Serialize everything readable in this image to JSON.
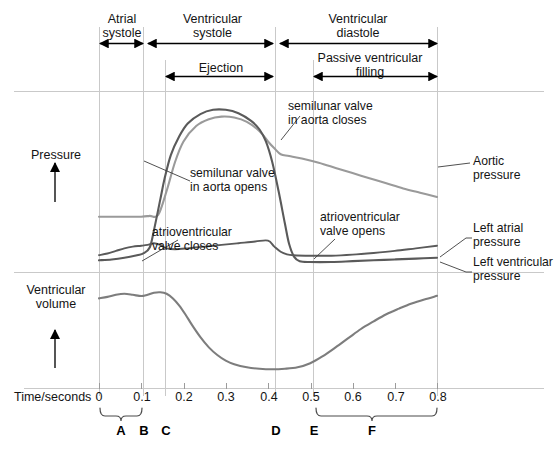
{
  "chart_data": {
    "type": "line",
    "xlabel": "Time/seconds",
    "xlim": [
      0,
      0.8
    ],
    "xticks": [
      "0",
      "0.1",
      "0.2",
      "0.3",
      "0.4",
      "0.5",
      "0.6",
      "0.7",
      "0.8"
    ],
    "grid": "vertical event lines only",
    "legend": "inline right-hand labels",
    "panels": [
      {
        "name": "pressure",
        "ylabel": "Pressure",
        "yaxis": "unlabelled, increasing upward",
        "series": [
          {
            "name": "Aortic pressure",
            "color": "#9a9a9a",
            "points": [
              [
                0.0,
                0.3
              ],
              [
                0.05,
                0.3
              ],
              [
                0.1,
                0.3
              ],
              [
                0.12,
                0.305
              ],
              [
                0.14,
                0.31
              ],
              [
                0.16,
                0.45
              ],
              [
                0.18,
                0.62
              ],
              [
                0.2,
                0.74
              ],
              [
                0.23,
                0.83
              ],
              [
                0.26,
                0.87
              ],
              [
                0.29,
                0.885
              ],
              [
                0.32,
                0.88
              ],
              [
                0.35,
                0.855
              ],
              [
                0.38,
                0.8
              ],
              [
                0.4,
                0.74
              ],
              [
                0.415,
                0.7
              ],
              [
                0.43,
                0.665
              ],
              [
                0.45,
                0.655
              ],
              [
                0.48,
                0.64
              ],
              [
                0.52,
                0.615
              ],
              [
                0.56,
                0.585
              ],
              [
                0.6,
                0.555
              ],
              [
                0.64,
                0.525
              ],
              [
                0.68,
                0.495
              ],
              [
                0.72,
                0.465
              ],
              [
                0.76,
                0.44
              ],
              [
                0.8,
                0.415
              ]
            ]
          },
          {
            "name": "Left ventricular pressure",
            "color": "#5a5a5a",
            "points": [
              [
                0.0,
                0.045
              ],
              [
                0.03,
                0.05
              ],
              [
                0.06,
                0.06
              ],
              [
                0.09,
                0.075
              ],
              [
                0.105,
                0.085
              ],
              [
                0.12,
                0.12
              ],
              [
                0.13,
                0.22
              ],
              [
                0.145,
                0.4
              ],
              [
                0.155,
                0.52
              ],
              [
                0.17,
                0.66
              ],
              [
                0.19,
                0.77
              ],
              [
                0.21,
                0.845
              ],
              [
                0.24,
                0.9
              ],
              [
                0.27,
                0.925
              ],
              [
                0.3,
                0.925
              ],
              [
                0.33,
                0.905
              ],
              [
                0.36,
                0.86
              ],
              [
                0.38,
                0.81
              ],
              [
                0.395,
                0.74
              ],
              [
                0.41,
                0.62
              ],
              [
                0.425,
                0.45
              ],
              [
                0.44,
                0.26
              ],
              [
                0.45,
                0.14
              ],
              [
                0.462,
                0.065
              ],
              [
                0.475,
                0.04
              ],
              [
                0.5,
                0.035
              ],
              [
                0.55,
                0.035
              ],
              [
                0.6,
                0.04
              ],
              [
                0.65,
                0.045
              ],
              [
                0.7,
                0.05
              ],
              [
                0.75,
                0.055
              ],
              [
                0.8,
                0.06
              ]
            ]
          },
          {
            "name": "Left atrial pressure",
            "color": "#5a5a5a",
            "points": [
              [
                0.0,
                0.075
              ],
              [
                0.02,
                0.085
              ],
              [
                0.04,
                0.1
              ],
              [
                0.06,
                0.115
              ],
              [
                0.08,
                0.125
              ],
              [
                0.1,
                0.13
              ],
              [
                0.115,
                0.135
              ],
              [
                0.13,
                0.145
              ],
              [
                0.145,
                0.135
              ],
              [
                0.16,
                0.115
              ],
              [
                0.18,
                0.11
              ],
              [
                0.21,
                0.115
              ],
              [
                0.25,
                0.125
              ],
              [
                0.29,
                0.135
              ],
              [
                0.33,
                0.145
              ],
              [
                0.37,
                0.155
              ],
              [
                0.4,
                0.16
              ],
              [
                0.415,
                0.125
              ],
              [
                0.43,
                0.095
              ],
              [
                0.445,
                0.08
              ],
              [
                0.46,
                0.075
              ],
              [
                0.5,
                0.072
              ],
              [
                0.55,
                0.072
              ],
              [
                0.6,
                0.078
              ],
              [
                0.65,
                0.088
              ],
              [
                0.7,
                0.1
              ],
              [
                0.75,
                0.115
              ],
              [
                0.8,
                0.13
              ]
            ]
          }
        ]
      },
      {
        "name": "volume",
        "ylabel": "Ventricular volume",
        "yaxis": "unlabelled, increasing upward",
        "series": [
          {
            "name": "Ventricular volume",
            "color": "#7d7d7d",
            "points": [
              [
                0.0,
                0.8
              ],
              [
                0.02,
                0.815
              ],
              [
                0.04,
                0.835
              ],
              [
                0.06,
                0.845
              ],
              [
                0.08,
                0.835
              ],
              [
                0.095,
                0.825
              ],
              [
                0.105,
                0.825
              ],
              [
                0.115,
                0.835
              ],
              [
                0.13,
                0.855
              ],
              [
                0.145,
                0.86
              ],
              [
                0.16,
                0.845
              ],
              [
                0.175,
                0.8
              ],
              [
                0.19,
                0.73
              ],
              [
                0.205,
                0.64
              ],
              [
                0.22,
                0.54
              ],
              [
                0.24,
                0.42
              ],
              [
                0.26,
                0.32
              ],
              [
                0.28,
                0.245
              ],
              [
                0.3,
                0.19
              ],
              [
                0.32,
                0.155
              ],
              [
                0.35,
                0.125
              ],
              [
                0.38,
                0.11
              ],
              [
                0.41,
                0.105
              ],
              [
                0.44,
                0.11
              ],
              [
                0.47,
                0.125
              ],
              [
                0.5,
                0.165
              ],
              [
                0.53,
                0.235
              ],
              [
                0.56,
                0.32
              ],
              [
                0.59,
                0.41
              ],
              [
                0.62,
                0.5
              ],
              [
                0.65,
                0.575
              ],
              [
                0.68,
                0.645
              ],
              [
                0.71,
                0.7
              ],
              [
                0.74,
                0.75
              ],
              [
                0.77,
                0.79
              ],
              [
                0.8,
                0.825
              ]
            ]
          }
        ]
      }
    ],
    "event_lines": [
      0.0,
      0.104,
      0.156,
      0.417,
      0.506,
      0.8
    ]
  },
  "phases": {
    "atrial_systole": "Atrial\nsystole",
    "ventricular_systole": "Ventricular\nsystole",
    "ventricular_diastole": "Ventricular\ndiastole",
    "ejection": "Ejection",
    "passive_filling": "Passive ventricular\nfilling"
  },
  "annotations": {
    "semilunar_opens": "semilunar valve\nin aorta opens",
    "semilunar_closes": "semilunar valve\nin aorta closes",
    "av_closes": "atrioventricular\nvalve closes",
    "av_opens": "atrioventricular\nvalve opens"
  },
  "series_labels": {
    "aortic": "Aortic\npressure",
    "left_atrial": "Left atrial\npressure",
    "left_ventricular": "Left ventricular\npressure"
  },
  "axes": {
    "pressure_label": "Pressure",
    "volume_label": "Ventricular\nvolume",
    "time_label": "Time/seconds",
    "ticks": [
      "0",
      "0.1",
      "0.2",
      "0.3",
      "0.4",
      "0.5",
      "0.6",
      "0.7",
      "0.8"
    ]
  },
  "markers": {
    "a": "A",
    "b": "B",
    "c": "C",
    "d": "D",
    "e": "E",
    "f": "F"
  },
  "colors": {
    "aortic": "#9a9a9a",
    "ventricular": "#5a5a5a",
    "atrial": "#5a5a5a",
    "volume": "#7d7d7d",
    "gridline": "#c9c9c9",
    "text": "#141414"
  }
}
